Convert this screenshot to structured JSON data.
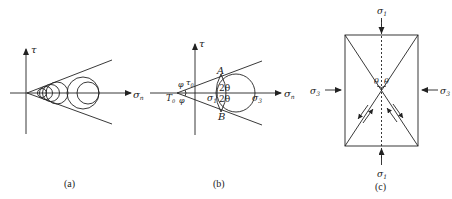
{
  "panels": [
    {
      "id": "a",
      "caption": "(a)",
      "axes": {
        "y_label": "τ",
        "x_label": "σ",
        "x_label_sub": "n"
      },
      "description": "Series of Mohr circles tangent to two straight envelope lines through the origin"
    },
    {
      "id": "b",
      "caption": "(b)",
      "axes": {
        "y_label": "τ",
        "x_label": "σ",
        "x_label_sub": "n"
      },
      "labels": {
        "point_A": "A",
        "point_B": "B",
        "angle_top": "2θ",
        "angle_bottom": "2θ",
        "sigma1": "σ",
        "sigma1_sub": "1",
        "sigma3": "σ",
        "sigma3_sub": "3",
        "tau0": "τ",
        "tau0_sub": "0",
        "T0": "T",
        "T0_sub": "0",
        "phi_top": "φ",
        "phi_bottom": "φ"
      }
    },
    {
      "id": "c",
      "caption": "(c)",
      "labels": {
        "sigma1_top": "σ",
        "sigma1_top_sub": "1",
        "sigma1_bottom": "σ",
        "sigma1_bottom_sub": "1",
        "sigma3_left": "σ",
        "sigma3_left_sub": "3",
        "sigma3_right": "σ",
        "sigma3_right_sub": "3",
        "theta_left": "θ",
        "theta_right": "θ"
      }
    }
  ],
  "colors": {
    "stroke": "#222222",
    "background": "#ffffff"
  }
}
